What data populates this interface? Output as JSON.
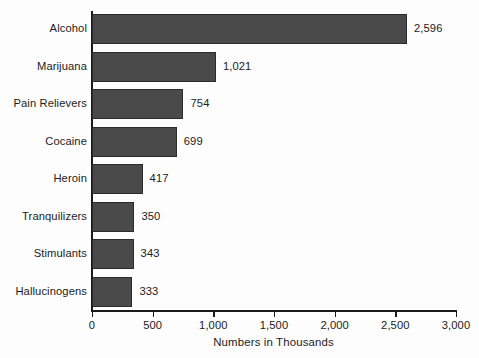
{
  "chart_data": {
    "type": "bar",
    "orientation": "horizontal",
    "title": "",
    "subtitle": "",
    "xlabel": "Numbers in Thousands",
    "ylabel": "",
    "categories": [
      "Alcohol",
      "Marijuana",
      "Pain Relievers",
      "Cocaine",
      "Heroin",
      "Tranquilizers",
      "Stimulants",
      "Hallucinogens"
    ],
    "values": [
      2596,
      1021,
      754,
      699,
      417,
      350,
      343,
      333
    ],
    "value_labels": [
      "2,596",
      "1,021",
      "754",
      "699",
      "417",
      "350",
      "343",
      "333"
    ],
    "xlim": [
      0,
      3000
    ],
    "xticks": [
      0,
      500,
      1000,
      1500,
      2000,
      2500,
      3000
    ],
    "xtick_labels": [
      "0",
      "500",
      "1,000",
      "1,500",
      "2,000",
      "2,500",
      "3,000"
    ],
    "grid": false,
    "legend": false,
    "legend_position": "none",
    "bar_color": "#4a4a4a",
    "bar_edge_color": "#2b2b2b",
    "axis_color": "#1a1a1a",
    "background_color": "#fdfdfd",
    "text_color": "#1c1c1c"
  }
}
